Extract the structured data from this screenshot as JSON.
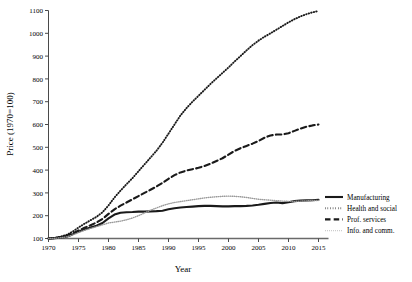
{
  "chart_data": {
    "type": "line",
    "title": "",
    "xlabel": "Year",
    "ylabel": "Price (1970=100)",
    "xlim": [
      1970,
      2015
    ],
    "ylim": [
      100,
      1100
    ],
    "xticks": [
      1970,
      1975,
      1980,
      1985,
      1990,
      1995,
      2000,
      2005,
      2010,
      2015
    ],
    "yticks": [
      100,
      200,
      300,
      400,
      500,
      600,
      700,
      800,
      900,
      1000,
      1100
    ],
    "grid": false,
    "legend_position": "right",
    "x": [
      1970,
      1971,
      1972,
      1973,
      1974,
      1975,
      1976,
      1977,
      1978,
      1979,
      1980,
      1981,
      1982,
      1983,
      1984,
      1985,
      1986,
      1987,
      1988,
      1989,
      1990,
      1991,
      1992,
      1993,
      1994,
      1995,
      1996,
      1997,
      1998,
      1999,
      2000,
      2001,
      2002,
      2003,
      2004,
      2005,
      2006,
      2007,
      2008,
      2009,
      2010,
      2011,
      2012,
      2013,
      2014,
      2015
    ],
    "series": [
      {
        "name": "Manufacturing",
        "style": "solid",
        "color": "#1a1a1a",
        "width": 2.1,
        "values": [
          100,
          101,
          103,
          108,
          118,
          130,
          140,
          148,
          156,
          168,
          188,
          205,
          213,
          215,
          216,
          218,
          218,
          219,
          220,
          222,
          228,
          233,
          236,
          238,
          240,
          242,
          243,
          243,
          242,
          241,
          241,
          242,
          242,
          243,
          245,
          248,
          252,
          256,
          258,
          255,
          259,
          264,
          266,
          267,
          268,
          270
        ]
      },
      {
        "name": "Health and social",
        "style": "dotted",
        "color": "#1a1a1a",
        "width": 1.9,
        "values": [
          100,
          103,
          108,
          116,
          130,
          148,
          165,
          180,
          195,
          215,
          245,
          280,
          310,
          338,
          365,
          395,
          425,
          455,
          485,
          520,
          560,
          600,
          640,
          672,
          700,
          726,
          752,
          778,
          802,
          826,
          850,
          876,
          900,
          925,
          948,
          968,
          985,
          1000,
          1016,
          1032,
          1048,
          1062,
          1074,
          1084,
          1092,
          1098
        ]
      },
      {
        "name": "Prof. services",
        "style": "dashed",
        "color": "#1a1a1a",
        "width": 2.1,
        "values": [
          100,
          102,
          106,
          112,
          122,
          135,
          147,
          158,
          170,
          186,
          208,
          228,
          244,
          258,
          272,
          286,
          300,
          314,
          328,
          344,
          362,
          378,
          390,
          398,
          404,
          410,
          418,
          428,
          440,
          452,
          468,
          484,
          496,
          506,
          516,
          528,
          542,
          552,
          556,
          556,
          562,
          572,
          582,
          590,
          596,
          600
        ]
      },
      {
        "name": "Info. and comm.",
        "style": "fine-dotted",
        "color": "#9a9a9a",
        "width": 1.4,
        "values": [
          100,
          101,
          103,
          107,
          115,
          126,
          136,
          144,
          152,
          160,
          168,
          172,
          176,
          182,
          190,
          200,
          212,
          224,
          234,
          244,
          252,
          258,
          262,
          266,
          270,
          274,
          278,
          281,
          283,
          285,
          286,
          285,
          283,
          280,
          276,
          272,
          270,
          268,
          266,
          264,
          263,
          263,
          264,
          265,
          266,
          267
        ]
      }
    ]
  },
  "axes": {
    "ylabel": "Price (1970=100)",
    "xlabel": "Year",
    "ytick_labels": [
      "100",
      "200",
      "300",
      "400",
      "500",
      "600",
      "700",
      "800",
      "900",
      "1000",
      "1100"
    ],
    "xtick_labels": [
      "1970",
      "1975",
      "1980",
      "1985",
      "1990",
      "1995",
      "2000",
      "2005",
      "2010",
      "2015"
    ]
  },
  "legend": {
    "entries": [
      {
        "label": "Manufacturing"
      },
      {
        "label": "Health and social"
      },
      {
        "label": "Prof. services"
      },
      {
        "label": "Info. and comm."
      }
    ]
  },
  "caption": {
    "text": ""
  }
}
